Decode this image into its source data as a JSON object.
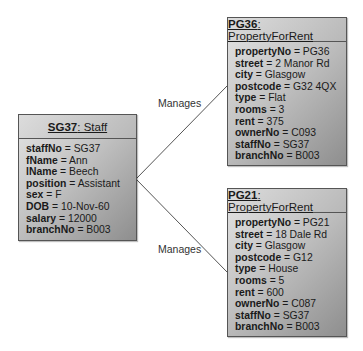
{
  "objects": {
    "staff": {
      "id": "SG37",
      "cls": ": Staff",
      "attrs": [
        {
          "name": "staffNo",
          "value": " = SG37"
        },
        {
          "name": "fName",
          "value": " = Ann"
        },
        {
          "name": "lName",
          "value": " = Beech"
        },
        {
          "name": "position",
          "value": " = Assistant"
        },
        {
          "name": "sex",
          "value": " = F"
        },
        {
          "name": "DOB",
          "value": " = 10-Nov-60"
        },
        {
          "name": "salary",
          "value": " = 12000"
        },
        {
          "name": "branchNo",
          "value": " = B003"
        }
      ]
    },
    "pg36": {
      "id": "PG36",
      "cls": ": PropertyForRent",
      "attrs": [
        {
          "name": "propertyNo",
          "value": " = PG36"
        },
        {
          "name": "street",
          "value": " = 2 Manor Rd"
        },
        {
          "name": "city",
          "value": " = Glasgow"
        },
        {
          "name": "postcode",
          "value": " = G32 4QX"
        },
        {
          "name": "type",
          "value": " = Flat"
        },
        {
          "name": "rooms",
          "value": " = 3"
        },
        {
          "name": "rent",
          "value": " = 375"
        },
        {
          "name": "ownerNo",
          "value": " = C093"
        },
        {
          "name": "staffNo",
          "value": " = SG37"
        },
        {
          "name": "branchNo",
          "value": " = B003"
        }
      ]
    },
    "pg21": {
      "id": "PG21",
      "cls": ": PropertyForRent",
      "attrs": [
        {
          "name": "propertyNo",
          "value": " = PG21"
        },
        {
          "name": "street",
          "value": " = 18 Dale Rd"
        },
        {
          "name": "city",
          "value": " = Glasgow"
        },
        {
          "name": "postcode",
          "value": " = G12"
        },
        {
          "name": "type",
          "value": " = House"
        },
        {
          "name": "rooms",
          "value": " = 5"
        },
        {
          "name": "rent",
          "value": " = 600"
        },
        {
          "name": "ownerNo",
          "value": " = C087"
        },
        {
          "name": "staffNo",
          "value": " = SG37"
        },
        {
          "name": "branchNo",
          "value": " = B003"
        }
      ]
    }
  },
  "links": [
    {
      "label": "Manages"
    },
    {
      "label": "Manages"
    }
  ]
}
